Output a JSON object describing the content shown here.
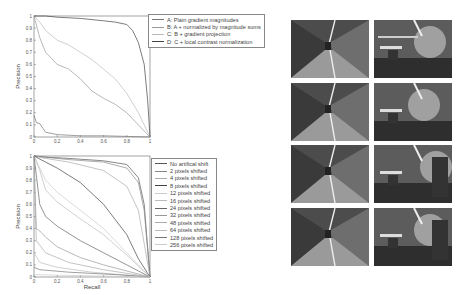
{
  "chart_data": [
    {
      "type": "line",
      "title": "",
      "xlabel": "Recall",
      "ylabel": "Precision",
      "xlim": [
        0,
        1
      ],
      "ylim": [
        0,
        1
      ],
      "xticks": [
        "0",
        "0.2",
        "0.4",
        "0.6",
        "0.8",
        "1"
      ],
      "yticks": [
        "0",
        "0.1",
        "0.2",
        "0.3",
        "0.4",
        "0.5",
        "0.6",
        "0.7",
        "0.8",
        "0.9",
        "1"
      ],
      "legend_position": "upper right outside",
      "series": [
        {
          "name": "A: Plain gradient magnitudes",
          "color": "#777777",
          "x": [
            0,
            0.02,
            0.05,
            0.1,
            0.2,
            0.4,
            0.6,
            0.8,
            1.0
          ],
          "y": [
            0.18,
            0.12,
            0.11,
            0.04,
            0.02,
            0.01,
            0.01,
            0.005,
            0.0
          ]
        },
        {
          "name": "B: A + normalized by magnitude sums",
          "color": "#999999",
          "x": [
            0,
            0.05,
            0.1,
            0.2,
            0.3,
            0.4,
            0.5,
            0.6,
            0.7,
            0.8,
            0.9,
            1.0
          ],
          "y": [
            1.0,
            0.82,
            0.7,
            0.6,
            0.56,
            0.48,
            0.38,
            0.32,
            0.27,
            0.2,
            0.1,
            0.0
          ]
        },
        {
          "name": "C: B + gradient projection",
          "color": "#bbbbbb",
          "x": [
            0,
            0.05,
            0.1,
            0.2,
            0.3,
            0.4,
            0.5,
            0.6,
            0.7,
            0.8,
            0.9,
            1.0
          ],
          "y": [
            1.0,
            0.95,
            0.88,
            0.8,
            0.76,
            0.7,
            0.64,
            0.56,
            0.48,
            0.36,
            0.2,
            0.0
          ]
        },
        {
          "name": "D: C + local contrast normalization",
          "color": "#444444",
          "x": [
            0,
            0.05,
            0.1,
            0.2,
            0.4,
            0.6,
            0.7,
            0.8,
            0.85,
            0.9,
            0.95,
            0.98,
            1.0
          ],
          "y": [
            1.0,
            1.0,
            1.0,
            0.99,
            0.98,
            0.96,
            0.95,
            0.93,
            0.88,
            0.78,
            0.6,
            0.3,
            0.0
          ]
        }
      ]
    },
    {
      "type": "line",
      "title": "",
      "xlabel": "Recall",
      "ylabel": "Precision",
      "xlim": [
        0,
        1
      ],
      "ylim": [
        0,
        1
      ],
      "xticks": [
        "0",
        "0.2",
        "0.4",
        "0.6",
        "0.8",
        "1"
      ],
      "yticks": [
        "0",
        "0.1",
        "0.2",
        "0.3",
        "0.4",
        "0.5",
        "0.6",
        "0.7",
        "0.8",
        "0.9",
        "1"
      ],
      "legend_position": "right outside",
      "series": [
        {
          "name": "No artifical shift",
          "color": "#555555",
          "x": [
            0,
            0.1,
            0.3,
            0.6,
            0.8,
            0.9,
            0.95,
            1.0
          ],
          "y": [
            1.0,
            0.99,
            0.98,
            0.96,
            0.93,
            0.82,
            0.6,
            0.0
          ]
        },
        {
          "name": "2 pixels shifted",
          "color": "#888888",
          "x": [
            0,
            0.1,
            0.3,
            0.6,
            0.8,
            0.9,
            0.95,
            1.0
          ],
          "y": [
            1.0,
            0.99,
            0.97,
            0.95,
            0.9,
            0.78,
            0.55,
            0.0
          ]
        },
        {
          "name": "4 pixels shifted",
          "color": "#aaaaaa",
          "x": [
            0,
            0.1,
            0.3,
            0.6,
            0.8,
            0.9,
            1.0
          ],
          "y": [
            1.0,
            0.98,
            0.95,
            0.88,
            0.75,
            0.55,
            0.0
          ]
        },
        {
          "name": "8 pixels shifted",
          "color": "#444444",
          "x": [
            0,
            0.1,
            0.2,
            0.4,
            0.6,
            0.8,
            0.9,
            1.0
          ],
          "y": [
            1.0,
            0.95,
            0.9,
            0.78,
            0.6,
            0.35,
            0.15,
            0.0
          ]
        },
        {
          "name": "12 pixels shifted",
          "color": "#cccccc",
          "x": [
            0,
            0.1,
            0.2,
            0.4,
            0.6,
            0.8,
            1.0
          ],
          "y": [
            1.0,
            0.8,
            0.7,
            0.55,
            0.4,
            0.2,
            0.0
          ]
        },
        {
          "name": "16 pixels shifted",
          "color": "#bbbbbb",
          "x": [
            0,
            0.05,
            0.1,
            0.2,
            0.4,
            0.6,
            0.8,
            1.0
          ],
          "y": [
            1.0,
            0.88,
            0.72,
            0.62,
            0.48,
            0.35,
            0.18,
            0.0
          ]
        },
        {
          "name": "24 pixels shifted",
          "color": "#666666",
          "x": [
            0,
            0.05,
            0.1,
            0.2,
            0.4,
            0.6,
            0.8,
            1.0
          ],
          "y": [
            1.0,
            0.6,
            0.5,
            0.42,
            0.3,
            0.2,
            0.1,
            0.0
          ]
        },
        {
          "name": "32 pixels shifted",
          "color": "#999999",
          "x": [
            0,
            0.02,
            0.05,
            0.1,
            0.2,
            0.4,
            0.6,
            0.8,
            1.0
          ],
          "y": [
            1.0,
            0.4,
            0.38,
            0.33,
            0.25,
            0.16,
            0.1,
            0.05,
            0.0
          ]
        },
        {
          "name": "48 pixels shifted",
          "color": "#aaaaaa",
          "x": [
            0,
            0.02,
            0.1,
            0.3,
            0.6,
            1.0
          ],
          "y": [
            0.9,
            0.3,
            0.2,
            0.12,
            0.06,
            0.0
          ]
        },
        {
          "name": "64 pixels shifted",
          "color": "#bbbbbb",
          "x": [
            0,
            0.05,
            0.2,
            0.5,
            1.0
          ],
          "y": [
            0.2,
            0.12,
            0.08,
            0.04,
            0.0
          ]
        },
        {
          "name": "128 pixels shifted",
          "color": "#777777",
          "x": [
            0,
            0.05,
            0.3,
            0.7,
            1.0
          ],
          "y": [
            0.08,
            0.06,
            0.04,
            0.02,
            0.0
          ]
        },
        {
          "name": "256 pixels shifted",
          "color": "#cccccc",
          "x": [
            0,
            0.2,
            0.5,
            1.0
          ],
          "y": [
            0.02,
            0.015,
            0.01,
            0.0
          ]
        }
      ]
    }
  ],
  "charts": {
    "top": {
      "xlabel": "Recall",
      "ylabel": "Precision",
      "legend": [
        "A: Plain gradient magnitudes",
        "B: A + normalized by magnitude sums",
        "C: B + gradient projection",
        "D: C + local contrast normalization"
      ]
    },
    "bottom": {
      "xlabel": "Recall",
      "ylabel": "Precision",
      "legend": [
        "No artifical shift",
        "2 pixels shifted",
        "4 pixels shifted",
        "8 pixels shifted",
        "12 pixels shifted",
        "16 pixels shifted",
        "24 pixels shifted",
        "32 pixels shifted",
        "48 pixels shifted",
        "64 pixels shifted",
        "128 pixels shifted",
        "256 pixels shifted"
      ]
    }
  },
  "image_grid": {
    "rows": 4,
    "cols": 2,
    "tiles": [
      {
        "scene": "corridor"
      },
      {
        "scene": "lab-shelves"
      },
      {
        "scene": "corridor"
      },
      {
        "scene": "lab-lamp"
      },
      {
        "scene": "corridor"
      },
      {
        "scene": "lab-panel"
      },
      {
        "scene": "corridor"
      },
      {
        "scene": "lab-panel"
      }
    ]
  }
}
